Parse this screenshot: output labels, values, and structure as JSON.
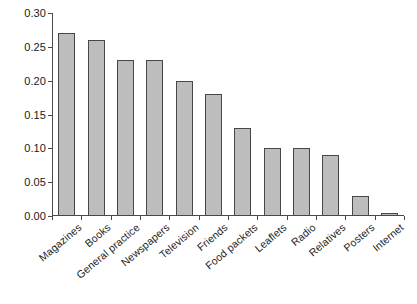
{
  "chart_data": {
    "type": "bar",
    "title": "",
    "subtitle": "",
    "xlabel": "",
    "ylabel": "",
    "ylim": [
      0.0,
      0.3
    ],
    "yticks": [
      "0.00",
      "0.05",
      "0.10",
      "0.15",
      "0.20",
      "0.25",
      "0.30"
    ],
    "ytick_values": [
      0.0,
      0.05,
      0.1,
      0.15,
      0.2,
      0.25,
      0.3
    ],
    "grid": false,
    "legend": null,
    "legend_position": "none",
    "bar_fill_color": "#bdbdbd",
    "bar_edge_color": "#474747",
    "axis_color": "#4a4a4a",
    "categories": [
      "Magazines",
      "Books",
      "General practice",
      "Newspapers",
      "Television",
      "Friends",
      "Food packets",
      "Leaflets",
      "Radio",
      "Relatives",
      "Posters",
      "Internet"
    ],
    "values": [
      0.27,
      0.26,
      0.23,
      0.23,
      0.2,
      0.18,
      0.13,
      0.1,
      0.1,
      0.09,
      0.03,
      0.005
    ]
  }
}
